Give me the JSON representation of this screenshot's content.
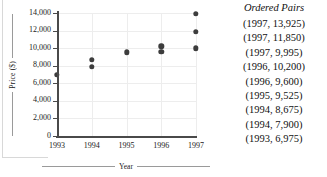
{
  "chart_data": {
    "type": "scatter",
    "title": "",
    "xlabel": "Year",
    "ylabel": "Price ($)",
    "xlim": [
      1993,
      1997
    ],
    "ylim": [
      0,
      14000
    ],
    "grid": true,
    "legend": "none",
    "x_ticks": [
      "1993",
      "1994",
      "1995",
      "1996",
      "1997"
    ],
    "y_ticks": [
      "0",
      "2,000",
      "4,000",
      "6,000",
      "8,000",
      "10,000",
      "12,000",
      "14,000"
    ],
    "y_tick_values": [
      0,
      2000,
      4000,
      6000,
      8000,
      10000,
      12000,
      14000
    ],
    "x_tick_values": [
      1993,
      1994,
      1995,
      1996,
      1997
    ],
    "points": [
      {
        "x": 1997,
        "y": 13925
      },
      {
        "x": 1997,
        "y": 11850
      },
      {
        "x": 1997,
        "y": 9995
      },
      {
        "x": 1996,
        "y": 10200
      },
      {
        "x": 1996,
        "y": 9600
      },
      {
        "x": 1995,
        "y": 9525
      },
      {
        "x": 1994,
        "y": 8675
      },
      {
        "x": 1994,
        "y": 7900
      },
      {
        "x": 1993,
        "y": 6975
      }
    ],
    "marker_color": "#3d3d3d",
    "axis_color": "#4a4a4a",
    "grid_color": "#ededed"
  },
  "pairs_panel": {
    "title": "Ordered Pairs",
    "items": [
      "(1997, 13,925)",
      "(1997, 11,850)",
      "(1997, 9,995)",
      "(1996, 10,200)",
      "(1996, 9,600)",
      "(1995, 9,525)",
      "(1994, 8,675)",
      "(1994, 7,900)",
      "(1993, 6,975)"
    ]
  }
}
